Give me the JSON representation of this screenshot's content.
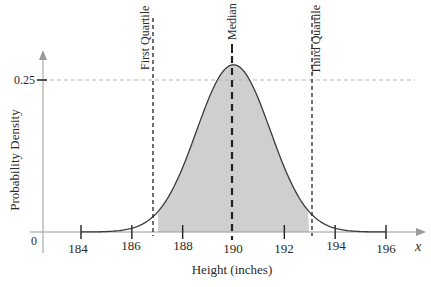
{
  "chart_data": {
    "type": "area",
    "title": "",
    "xlabel": "Height (inches)",
    "ylabel": "Probability Density",
    "x_axis_symbol": "x",
    "distribution": "normal",
    "mean": 190,
    "median": 190,
    "std_dev": 1.45,
    "xlim": [
      183,
      197
    ],
    "ylim": [
      0,
      0.28
    ],
    "x_ticks": [
      184,
      186,
      188,
      190,
      192,
      194,
      196
    ],
    "x_tick_labels": [
      "184",
      "186",
      "188",
      "190",
      "192",
      "194",
      "196"
    ],
    "y_ticks": [
      0,
      0.25
    ],
    "y_tick_labels": [
      "0",
      "0.25"
    ],
    "reference_line_y": 0.25,
    "curve_domain": [
      184,
      196
    ],
    "peak_density": 0.275,
    "shaded_region": {
      "from": 187,
      "to": 193,
      "color": "#cfcfcf"
    },
    "vertical_markers": [
      {
        "label": "First Quartile",
        "x": 187,
        "style": "dashed"
      },
      {
        "label": "Median",
        "x": 190,
        "style": "dashed-bold"
      },
      {
        "label": "Third Quartile",
        "x": 193,
        "style": "dashed"
      }
    ],
    "grid": false,
    "legend": null
  },
  "labels": {
    "y_axis_title": "Probability Density",
    "x_axis_title": "Height (inches)",
    "x_symbol": "x",
    "zero": "0",
    "y_tick": "0.25",
    "first_quartile": "First Quartile",
    "median": "Median",
    "third_quartile": "Third Quartile",
    "ticks": [
      "184",
      "186",
      "188",
      "190",
      "192",
      "194",
      "196"
    ]
  },
  "colors": {
    "curve": "#3a3a3a",
    "fill": "#cfcfcf",
    "axis": "#9a9a9a",
    "reference_line": "#b5b5b5",
    "markers": "#222222"
  }
}
